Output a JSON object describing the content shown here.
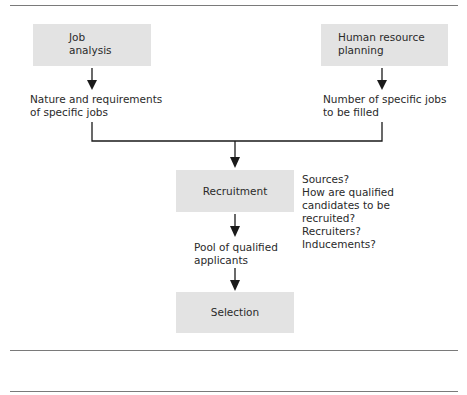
{
  "diagram": {
    "nodes": {
      "job_analysis": {
        "label_line1": "Job",
        "label_line2": "analysis"
      },
      "hr_planning": {
        "label_line1": "Human resource",
        "label_line2": "planning"
      },
      "recruitment": {
        "label": "Recruitment"
      },
      "selection": {
        "label": "Selection"
      }
    },
    "outputs": {
      "job_analysis_output": {
        "line1": "Nature and requirements",
        "line2": "of specific jobs"
      },
      "hr_planning_output": {
        "line1": "Number of specific jobs",
        "line2": "to be filled"
      },
      "recruitment_output": {
        "line1": "Pool of qualified",
        "line2": "applicants"
      }
    },
    "recruitment_questions": [
      "Sources?",
      "How are qualified",
      "candidates to be",
      "recruited?",
      "Recruiters?",
      "Inducements?"
    ],
    "colors": {
      "box_fill": "#e3e3e3",
      "line": "#1a1a1a",
      "rule": "#7a7a7a"
    }
  }
}
